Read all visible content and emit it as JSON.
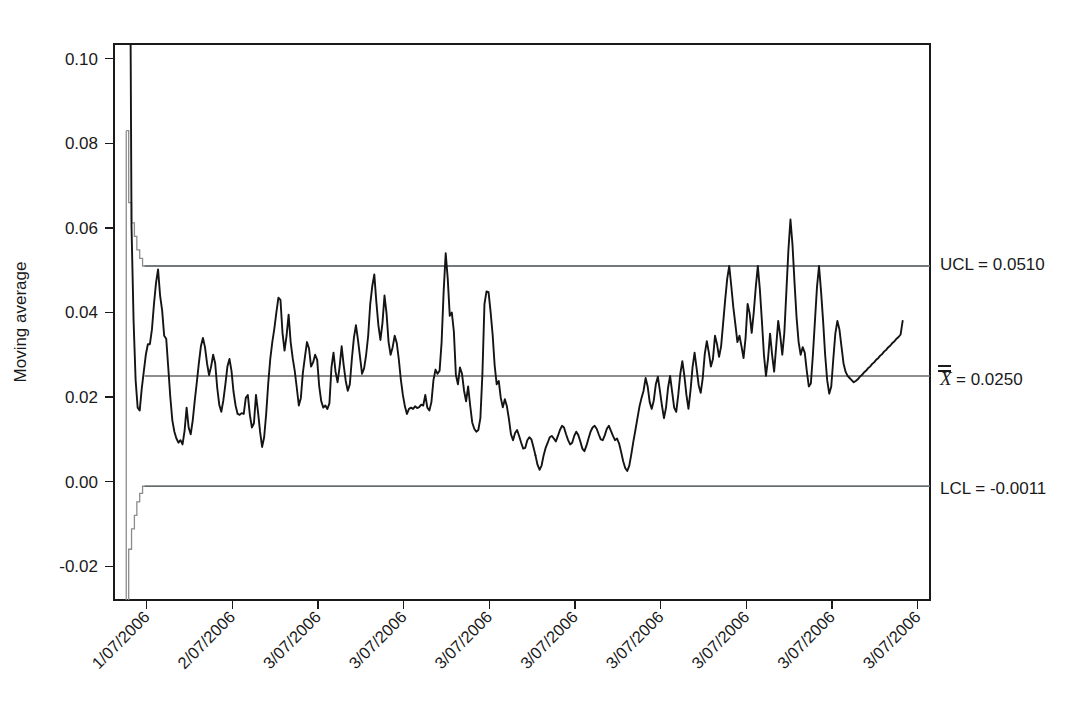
{
  "chart_data": {
    "type": "line",
    "title": "",
    "subtitle": "",
    "xlabel": "",
    "ylabel": "Moving average",
    "ylim": [
      -0.028,
      0.1035
    ],
    "xlim": [
      0,
      200
    ],
    "grid": false,
    "legend_position": "right-outside",
    "y_ticks": [
      0.1,
      0.08,
      0.06,
      0.04,
      0.02,
      0.0,
      -0.02
    ],
    "y_tick_labels": [
      "0.10",
      "0.08",
      "0.06",
      "0.04",
      "0.02",
      "0.00",
      "-0.02"
    ],
    "x_tick_labels": [
      "1/07/2006",
      "2/07/2006",
      "3/07/2006",
      "3/07/2006",
      "3/07/2006",
      "3/07/2006",
      "3/07/2006",
      "3/07/2006",
      "3/07/2006",
      "3/07/2006"
    ],
    "x_tick_positions": [
      8,
      29,
      50,
      71,
      92,
      113,
      134,
      155,
      176,
      197
    ],
    "annotations": [
      {
        "name": "ucl",
        "label": "UCL = 0.0510",
        "value": 0.051
      },
      {
        "name": "centerline",
        "label": "= 0.0250",
        "symbol": "X",
        "value": 0.025
      },
      {
        "name": "lcl",
        "label": "LCL = -0.0011",
        "value": -0.0011
      }
    ],
    "control_limits": {
      "ucl_label": "UCL = 0.0510",
      "ucl_value": 0.051,
      "center_symbol": "X",
      "center_label": "= 0.0250",
      "center_value": 0.025,
      "lcl_label": "LCL = -0.0011",
      "lcl_value": -0.0011,
      "stabilizes_at_x": 7.5
    },
    "ucl_steps": [
      [
        3.0,
        0.083
      ],
      [
        3.6,
        0.083
      ],
      [
        3.6,
        0.066
      ],
      [
        4.3,
        0.066
      ],
      [
        4.3,
        0.0612
      ],
      [
        5.0,
        0.0612
      ],
      [
        5.0,
        0.058
      ],
      [
        5.6,
        0.058
      ],
      [
        5.6,
        0.0548
      ],
      [
        6.3,
        0.0548
      ],
      [
        6.3,
        0.0528
      ],
      [
        7.0,
        0.0528
      ],
      [
        7.0,
        0.051
      ],
      [
        200,
        0.051
      ]
    ],
    "lcl_steps": [
      [
        3.0,
        -0.033
      ],
      [
        3.6,
        -0.033
      ],
      [
        3.6,
        -0.016
      ],
      [
        4.3,
        -0.016
      ],
      [
        4.3,
        -0.0112
      ],
      [
        5.0,
        -0.0112
      ],
      [
        5.0,
        -0.008
      ],
      [
        5.6,
        -0.008
      ],
      [
        5.6,
        -0.0048
      ],
      [
        6.3,
        -0.0048
      ],
      [
        6.3,
        -0.0028
      ],
      [
        7.0,
        -0.0028
      ],
      [
        7.0,
        -0.0011
      ],
      [
        200,
        -0.0011
      ]
    ],
    "series": [
      {
        "name": "Moving average",
        "color": "#141414",
        "clipped_top": true,
        "x": [
          4.0,
          4.3,
          4.8,
          5.3,
          5.8,
          6.3,
          6.8,
          7.3,
          7.8,
          8.3,
          8.8,
          9.3,
          9.8,
          10.3,
          10.8,
          11.3,
          11.8,
          12.3,
          12.8,
          13.3,
          13.8,
          14.3,
          14.8,
          15.3,
          15.8,
          16.3,
          16.8,
          17.3,
          17.8,
          18.3,
          18.8,
          19.3,
          19.8,
          20.3,
          20.8,
          21.3,
          21.8,
          22.3,
          22.8,
          23.3,
          23.8,
          24.3,
          24.8,
          25.3,
          25.8,
          26.3,
          26.8,
          27.3,
          27.8,
          28.3,
          28.8,
          29.3,
          29.8,
          30.3,
          30.8,
          31.3,
          31.8,
          32.3,
          32.8,
          33.3,
          33.8,
          34.3,
          34.8,
          35.3,
          35.8,
          36.3,
          36.8,
          37.3,
          37.8,
          38.3,
          38.8,
          39.3,
          39.8,
          40.3,
          40.8,
          41.3,
          41.8,
          42.3,
          42.8,
          43.3,
          43.8,
          44.3,
          44.8,
          45.3,
          45.8,
          46.3,
          46.8,
          47.3,
          47.8,
          48.3,
          48.8,
          49.3,
          49.8,
          50.3,
          50.8,
          51.3,
          51.8,
          52.3,
          52.8,
          53.3,
          53.8,
          54.3,
          54.8,
          55.3,
          55.8,
          56.3,
          56.8,
          57.3,
          57.8,
          58.3,
          58.8,
          59.3,
          59.8,
          60.3,
          60.8,
          61.3,
          61.8,
          62.3,
          62.8,
          63.3,
          63.8,
          64.3,
          64.8,
          65.3,
          65.8,
          66.3,
          66.8,
          67.3,
          67.8,
          68.3,
          68.8,
          69.3,
          69.8,
          70.3,
          70.8,
          71.3,
          71.8,
          72.3,
          72.8,
          73.3,
          73.8,
          74.3,
          74.8,
          75.3,
          75.8,
          76.3,
          76.8,
          77.3,
          77.8,
          78.3,
          78.8,
          79.3,
          79.8,
          80.3,
          80.8,
          81.3,
          81.8,
          82.3,
          82.8,
          83.3,
          83.8,
          84.3,
          84.8,
          85.3,
          85.8,
          86.3,
          86.8,
          87.3,
          87.8,
          88.3,
          88.8,
          89.3,
          89.8,
          90.3,
          90.8,
          91.3,
          91.8,
          92.3,
          92.8,
          93.3,
          93.8,
          94.3,
          94.8,
          95.3,
          95.8,
          96.3,
          96.8,
          97.3,
          97.8,
          98.3,
          98.8,
          99.3,
          99.8,
          100.3,
          100.8,
          101.3,
          101.8,
          102.3,
          102.8,
          103.3
        ],
        "values": [
          0.118,
          0.06,
          0.038,
          0.024,
          0.0175,
          0.0168,
          0.022,
          0.026,
          0.03,
          0.0325,
          0.0325,
          0.036,
          0.042,
          0.047,
          0.0502,
          0.044,
          0.0405,
          0.0345,
          0.0338,
          0.027,
          0.02,
          0.0145,
          0.0118,
          0.0102,
          0.0092,
          0.0098,
          0.0088,
          0.012,
          0.0175,
          0.0128,
          0.0112,
          0.0145,
          0.0192,
          0.0235,
          0.028,
          0.032,
          0.034,
          0.0318,
          0.028,
          0.0252,
          0.0272,
          0.03,
          0.028,
          0.0222,
          0.0182,
          0.0165,
          0.0192,
          0.023,
          0.0272,
          0.029,
          0.0262,
          0.0212,
          0.018,
          0.016,
          0.0158,
          0.0162,
          0.016,
          0.0198,
          0.0205,
          0.0158,
          0.0128,
          0.0138,
          0.0205,
          0.0165,
          0.0118,
          0.0082,
          0.0105,
          0.016,
          0.0232,
          0.029,
          0.033,
          0.0362,
          0.04,
          0.0435,
          0.043,
          0.0352,
          0.031,
          0.0345,
          0.0395,
          0.033,
          0.0292,
          0.0262,
          0.0222,
          0.018,
          0.0198,
          0.0258,
          0.0295,
          0.033,
          0.0315,
          0.0272,
          0.0282,
          0.03,
          0.0288,
          0.0225,
          0.019,
          0.0175,
          0.018,
          0.0172,
          0.0185,
          0.027,
          0.0305,
          0.026,
          0.0235,
          0.0272,
          0.032,
          0.0275,
          0.0238,
          0.0215,
          0.023,
          0.029,
          0.034,
          0.037,
          0.0335,
          0.0295,
          0.0255,
          0.0268,
          0.03,
          0.0345,
          0.042,
          0.0462,
          0.049,
          0.0425,
          0.037,
          0.0335,
          0.0375,
          0.044,
          0.0398,
          0.033,
          0.03,
          0.0318,
          0.0345,
          0.0328,
          0.029,
          0.0242,
          0.0205,
          0.0178,
          0.016,
          0.0172,
          0.0175,
          0.0172,
          0.0178,
          0.0174,
          0.0176,
          0.0182,
          0.018,
          0.0205,
          0.0175,
          0.0168,
          0.0188,
          0.024,
          0.0265,
          0.0255,
          0.0262,
          0.033,
          0.045,
          0.054,
          0.048,
          0.0392,
          0.04,
          0.0355,
          0.0252,
          0.023,
          0.027,
          0.0255,
          0.0215,
          0.019,
          0.0225,
          0.018,
          0.014,
          0.0125,
          0.0118,
          0.0122,
          0.015,
          0.0255,
          0.042,
          0.045,
          0.0448,
          0.0402,
          0.0348,
          0.0275,
          0.023,
          0.0238,
          0.0198,
          0.0176,
          0.0195,
          0.0178,
          0.0148,
          0.0112,
          0.0098,
          0.0115,
          0.0122,
          0.0108,
          0.0092,
          0.0078,
          0.008,
          0.0098,
          0.0105,
          0.01,
          0.0082,
          0.0062
        ]
      },
      {
        "name": "Moving average (cont.)",
        "color": "#141414",
        "x": [
          103.3,
          103.8,
          104.3,
          104.8,
          105.3,
          105.8,
          106.3,
          106.8,
          107.3,
          107.8,
          108.3,
          108.8,
          109.3,
          109.8,
          110.3,
          110.8,
          111.3,
          111.8,
          112.3,
          112.8,
          113.3,
          113.8,
          114.3,
          114.8,
          115.3,
          115.8,
          116.3,
          116.8,
          117.3,
          117.8,
          118.3,
          118.8,
          119.3,
          119.8,
          120.3,
          120.8,
          121.3,
          121.8,
          122.3,
          122.8,
          123.3,
          123.8,
          124.3,
          124.8,
          125.3,
          125.8,
          126.3,
          126.8,
          127.3,
          127.8,
          128.3,
          128.8,
          129.3,
          129.8,
          130.3,
          130.8,
          131.3,
          131.8,
          132.3,
          132.8,
          133.3,
          133.8,
          134.3,
          134.8,
          135.3,
          135.8,
          136.3,
          136.8,
          137.3,
          137.8,
          138.3,
          138.8,
          139.3,
          139.8,
          140.3,
          140.8,
          141.3,
          141.8,
          142.3,
          142.8,
          143.3,
          143.8,
          144.3,
          144.8,
          145.3,
          145.8,
          146.3,
          146.8,
          147.3,
          147.8,
          148.3,
          148.8,
          149.3,
          149.8,
          150.3,
          150.8,
          151.3,
          151.8,
          152.3,
          152.8,
          153.3,
          153.8,
          154.3,
          154.8,
          155.3,
          155.8,
          156.3,
          156.8,
          157.3,
          157.8,
          158.3,
          158.8,
          159.3,
          159.8,
          160.3,
          160.8,
          161.3,
          161.8,
          162.3,
          162.8,
          163.3,
          163.8,
          164.3,
          164.8,
          165.3,
          165.8,
          166.3,
          166.8,
          167.3,
          167.8,
          168.3,
          168.8,
          169.3,
          169.8,
          170.3,
          170.8,
          171.3,
          171.8,
          172.3,
          172.8,
          173.3,
          173.8,
          174.3,
          174.8,
          175.3,
          175.8,
          176.3,
          176.8,
          177.3,
          177.8,
          178.3,
          178.8,
          179.3,
          179.8,
          180.3,
          180.8,
          181.3,
          181.8,
          182.3,
          182.8,
          183.3,
          183.8,
          184.3,
          184.8,
          185.3,
          185.8,
          186.3,
          186.8,
          187.3,
          187.8,
          188.3,
          188.8,
          189.3,
          189.8,
          190.3,
          190.8,
          191.3,
          191.8,
          192.3,
          192.8,
          193.3
        ],
        "values": [
          0.0062,
          0.004,
          0.0028,
          0.0038,
          0.0062,
          0.008,
          0.0092,
          0.0105,
          0.0108,
          0.0102,
          0.0095,
          0.0108,
          0.0122,
          0.0132,
          0.0128,
          0.0112,
          0.0098,
          0.0088,
          0.0092,
          0.0108,
          0.0118,
          0.011,
          0.0095,
          0.0078,
          0.0072,
          0.0085,
          0.0102,
          0.0118,
          0.0128,
          0.0132,
          0.0125,
          0.0112,
          0.01,
          0.0098,
          0.011,
          0.0125,
          0.0132,
          0.012,
          0.0108,
          0.0098,
          0.0102,
          0.009,
          0.007,
          0.0048,
          0.0032,
          0.0025,
          0.0038,
          0.0065,
          0.0095,
          0.0122,
          0.015,
          0.0178,
          0.0198,
          0.0215,
          0.0245,
          0.0225,
          0.0188,
          0.0172,
          0.0192,
          0.023,
          0.0248,
          0.0215,
          0.018,
          0.015,
          0.0175,
          0.0222,
          0.025,
          0.0212,
          0.0175,
          0.0165,
          0.0205,
          0.0255,
          0.0285,
          0.025,
          0.0205,
          0.0172,
          0.0215,
          0.027,
          0.0305,
          0.0268,
          0.0228,
          0.021,
          0.0245,
          0.0302,
          0.0332,
          0.0305,
          0.0272,
          0.029,
          0.0345,
          0.0325,
          0.0295,
          0.032,
          0.0375,
          0.043,
          0.048,
          0.051,
          0.0462,
          0.0412,
          0.0372,
          0.033,
          0.0345,
          0.032,
          0.0292,
          0.034,
          0.042,
          0.0398,
          0.0352,
          0.04,
          0.046,
          0.051,
          0.0455,
          0.038,
          0.03,
          0.025,
          0.029,
          0.035,
          0.03,
          0.026,
          0.032,
          0.038,
          0.0345,
          0.03,
          0.0352,
          0.045,
          0.0548,
          0.062,
          0.056,
          0.047,
          0.0388,
          0.033,
          0.03,
          0.0318,
          0.0305,
          0.0262,
          0.0225,
          0.0232,
          0.03,
          0.038,
          0.046,
          0.051,
          0.045,
          0.038,
          0.03,
          0.024,
          0.0208,
          0.0225,
          0.029,
          0.035,
          0.038,
          0.036,
          0.032,
          0.028,
          0.026,
          0.025,
          0.0245,
          0.024,
          0.0235,
          0.0238,
          0.0242,
          0.0248,
          0.0252,
          0.0258,
          0.0262,
          0.0268,
          0.0272,
          0.0278,
          0.0282,
          0.0288,
          0.0292,
          0.0298,
          0.0302,
          0.0308,
          0.0312,
          0.0318,
          0.0322,
          0.0328,
          0.0332,
          0.0338,
          0.0342,
          0.0348,
          0.038
        ]
      }
    ]
  }
}
